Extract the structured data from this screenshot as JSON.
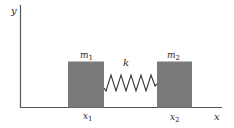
{
  "diagram": {
    "type": "two-mass spring system",
    "axes": {
      "x_label": "x",
      "y_label": "y"
    },
    "masses": [
      {
        "label": "m",
        "subscript": "1",
        "position_label": "x",
        "position_subscript": "1"
      },
      {
        "label": "m",
        "subscript": "2",
        "position_label": "x",
        "position_subscript": "2"
      }
    ],
    "spring": {
      "label": "k",
      "zigzags": 5
    },
    "colors": {
      "axis": "#555555",
      "mass_fill": "#7a7a7a",
      "spring": "#333333",
      "text": "#2a2a2a",
      "background": "#ffffff"
    }
  }
}
